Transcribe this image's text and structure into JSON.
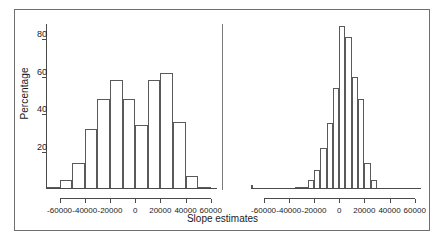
{
  "chart_data": {
    "type": "bar",
    "title": "",
    "xlabel": "Slope estimates",
    "ylabel": "Percentage",
    "ylim": [
      0,
      88
    ],
    "xlim": [
      -70000,
      65000
    ],
    "grid": false,
    "legend": null,
    "panels": [
      {
        "name": "left-histogram",
        "xticks": [
          -60000,
          -40000,
          -20000,
          0,
          20000,
          40000,
          60000
        ],
        "xticklabels": [
          "-60000",
          "-40000",
          "-20000",
          "0",
          "20000",
          "40000",
          "60000"
        ],
        "bin_width": 10000,
        "bin_starts": [
          -70000,
          -60000,
          -50000,
          -40000,
          -30000,
          -20000,
          -10000,
          0,
          10000,
          20000,
          30000,
          40000,
          50000
        ],
        "bin_centers": [
          -65000,
          -55000,
          -45000,
          -35000,
          -25000,
          -15000,
          -5000,
          5000,
          15000,
          25000,
          35000,
          45000,
          55000
        ],
        "values": [
          1,
          5,
          14,
          32,
          48,
          58,
          48,
          34,
          58,
          62,
          36,
          7,
          1
        ]
      },
      {
        "name": "right-histogram",
        "xticks": [
          -60000,
          -40000,
          -20000,
          0,
          20000,
          40000,
          60000
        ],
        "xticklabels": [
          "-60000",
          "-40000",
          "-20000",
          "0",
          "20000",
          "40000",
          "60000"
        ],
        "bin_width": 5000,
        "bin_starts": [
          -35000,
          -30000,
          -25000,
          -20000,
          -15000,
          -10000,
          -5000,
          0,
          5000,
          10000,
          15000,
          20000,
          25000
        ],
        "bin_centers": [
          -32500,
          -27500,
          -22500,
          -17500,
          -12500,
          -7500,
          -2500,
          2500,
          7500,
          12500,
          17500,
          22500,
          27500
        ],
        "values": [
          1,
          1,
          5,
          10,
          22,
          35,
          54,
          87,
          81,
          60,
          48,
          14,
          5,
          2
        ]
      }
    ],
    "yticks": [
      20,
      40,
      60,
      80
    ],
    "yticklabels": [
      "20",
      "40",
      "60",
      "80"
    ],
    "axis_color": "#4a4a4a",
    "bar_edge_color": "#5a5a5a",
    "bar_fill_color": "#ffffff",
    "border_color": "#6f6f6f"
  }
}
